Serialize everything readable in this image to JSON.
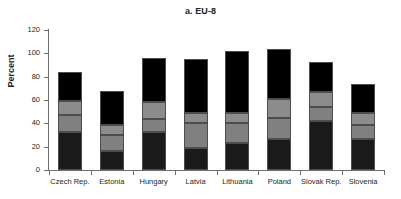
{
  "chart_data": {
    "type": "bar",
    "stacked": true,
    "title": "a. EU-8",
    "xlabel": "",
    "ylabel": "Percent",
    "ylim": [
      0,
      120
    ],
    "yticks": [
      0,
      20,
      40,
      60,
      80,
      100,
      120
    ],
    "grid": false,
    "legend": "none",
    "categories": [
      "Czech Rep.",
      "Estonia",
      "Hungary",
      "Latvia",
      "Lithuania",
      "Poland",
      "Slovak Rep.",
      "Slovenia"
    ],
    "series": [
      {
        "name": "segment-1",
        "color": "#1a1a1a",
        "values": [
          33,
          16,
          33,
          19,
          23,
          27,
          42,
          27
        ]
      },
      {
        "name": "segment-2",
        "color": "#808080",
        "values": [
          14,
          14,
          11,
          21,
          17,
          18,
          12,
          12
        ]
      },
      {
        "name": "segment-3",
        "color": "#8c8c8c",
        "values": [
          12,
          9,
          14,
          9,
          9,
          16,
          13,
          10
        ]
      },
      {
        "name": "segment-4",
        "color": "#000000",
        "values": [
          25,
          29,
          38,
          46,
          53,
          43,
          26,
          25
        ]
      }
    ],
    "totals": [
      84,
      68,
      96,
      95,
      102,
      104,
      93,
      74
    ]
  },
  "colors": {
    "axis": "#6d6e71",
    "text": "#231f20",
    "background": "#ffffff"
  }
}
